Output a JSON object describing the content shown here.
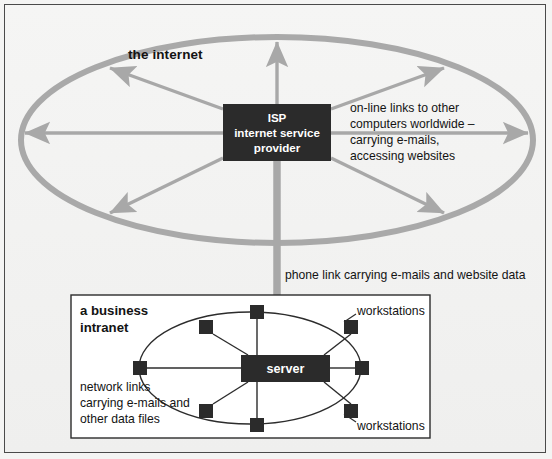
{
  "diagram": {
    "colors": {
      "page_background": "#f4f4f3",
      "frame_border": "#4a4a4a",
      "cloud_stroke": "#a8a8a8",
      "arrow_gray": "#a8a8a8",
      "node_dark": "#2b2b2b",
      "box_dark": "#2b2b2b",
      "box_text": "#ffffff",
      "intranet_fill": "#ffffff",
      "intranet_border": "#2c2c2c",
      "link_line": "#2c2c2c",
      "text": "#131313"
    },
    "internet": {
      "label": "the internet",
      "shape": "ellipse",
      "center": {
        "x": 277,
        "y": 140
      },
      "radius": {
        "rx": 258,
        "ry": 104
      },
      "isp_box": {
        "label": "ISP\ninternet service\nprovider",
        "lines": [
          "ISP",
          "internet service",
          "provider"
        ],
        "x": 223,
        "y": 104,
        "width": 108,
        "height": 57
      },
      "online_note": "on-line links to other\ncomputers worldwide –\ncarrying e-mails,\naccessing websites",
      "online_note_lines": [
        "on-line links to other",
        "computers worldwide –",
        "carrying e-mails,",
        "accessing websites"
      ],
      "arrow_count": 7,
      "arrow_directions": [
        "up",
        "left",
        "right",
        "up-left",
        "up-right",
        "down-left",
        "down-right"
      ]
    },
    "phone_link": {
      "label": "phone link carrying e-mails and website data",
      "direction": "down",
      "from": "ISP box",
      "to": "server"
    },
    "intranet": {
      "label": "a business\nintranet",
      "label_lines": [
        "a business",
        "intranet"
      ],
      "box": {
        "x": 71,
        "y": 295,
        "width": 359,
        "height": 143
      },
      "server_box": {
        "label": "server",
        "x": 241,
        "y": 355,
        "width": 89,
        "height": 27
      },
      "ring": {
        "center": {
          "x": 250,
          "y": 368
        },
        "radius": {
          "rx": 115,
          "ry": 62
        }
      },
      "network_note": "network links\ncarrying e-mails and\nother data files",
      "network_note_lines": [
        "network links",
        "carrying e-mails and",
        "other data files"
      ],
      "workstations_label_top": "workstations",
      "workstations_label_bottom": "workstations",
      "workstation_count": 8,
      "workstation_nodes": [
        {
          "id": "ws-n",
          "x": 250,
          "y": 312,
          "size": 14,
          "position": "top"
        },
        {
          "id": "ws-nw",
          "x": 207,
          "y": 327,
          "size": 14,
          "position": "top-left"
        },
        {
          "id": "ws-ne",
          "x": 351,
          "y": 327,
          "size": 14,
          "position": "top-right"
        },
        {
          "id": "ws-w",
          "x": 139,
          "y": 368,
          "size": 14,
          "position": "left"
        },
        {
          "id": "ws-e",
          "x": 361,
          "y": 368,
          "size": 14,
          "position": "right"
        },
        {
          "id": "ws-sw",
          "x": 207,
          "y": 410,
          "size": 14,
          "position": "bottom-left"
        },
        {
          "id": "ws-se",
          "x": 351,
          "y": 410,
          "size": 14,
          "position": "bottom-right"
        },
        {
          "id": "ws-s",
          "x": 250,
          "y": 424,
          "size": 14,
          "position": "bottom"
        }
      ]
    }
  }
}
